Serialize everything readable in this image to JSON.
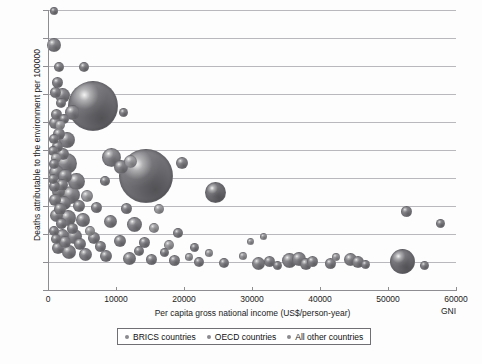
{
  "chart_data": {
    "type": "scatter",
    "title": "",
    "xlabel": "Per capita gross national income (US$/person-year)",
    "ylabel": "Deaths attributable to the environment per 100000",
    "x_axis_note": "GNI",
    "xlim": [
      0,
      60000
    ],
    "ylim": [
      0,
      500
    ],
    "xticks": [
      0,
      10000,
      20000,
      30000,
      40000,
      50000,
      60000
    ],
    "xtick_labels": [
      "0",
      "10000",
      "20000",
      "30000",
      "40000",
      "50000",
      "60000"
    ],
    "yticks": [
      0,
      50,
      100,
      150,
      200,
      250,
      300,
      350,
      400,
      450,
      500
    ],
    "ytick_labels": [
      "0",
      "50",
      "100",
      "150",
      "200",
      "250",
      "300",
      "350",
      "400",
      "450",
      "500"
    ],
    "grid": "horizontal",
    "legend_position": "bottom",
    "legend": [
      {
        "label": "BRICS countries",
        "color": "#8a8a8f"
      },
      {
        "label": "OECD countries",
        "color": "#8a8a8f"
      },
      {
        "label": "All other countries",
        "color": "#8a8a8f"
      }
    ],
    "bubble_size_meaning": "population",
    "points": [
      {
        "x": 800,
        "y": 500,
        "r": 3.0,
        "tone": "mid"
      },
      {
        "x": 700,
        "y": 440,
        "r": 6.0,
        "tone": "mid"
      },
      {
        "x": 1400,
        "y": 400,
        "r": 4.0,
        "tone": "mid"
      },
      {
        "x": 5200,
        "y": 400,
        "r": 4.0,
        "tone": "mid"
      },
      {
        "x": 1200,
        "y": 372,
        "r": 4.5,
        "tone": "mid"
      },
      {
        "x": 900,
        "y": 355,
        "r": 4.5,
        "tone": "mid"
      },
      {
        "x": 2000,
        "y": 350,
        "r": 6.5,
        "tone": "mid"
      },
      {
        "x": 6400,
        "y": 330,
        "r": 24.0,
        "tone": "dark"
      },
      {
        "x": 3500,
        "y": 318,
        "r": 6.5,
        "tone": "mid"
      },
      {
        "x": 1100,
        "y": 316,
        "r": 4.5,
        "tone": "mid"
      },
      {
        "x": 2200,
        "y": 308,
        "r": 4.0,
        "tone": "mid"
      },
      {
        "x": 900,
        "y": 300,
        "r": 5.0,
        "tone": "mid"
      },
      {
        "x": 1600,
        "y": 296,
        "r": 4.0,
        "tone": "light"
      },
      {
        "x": 11000,
        "y": 318,
        "r": 3.5,
        "tone": "mid"
      },
      {
        "x": 1500,
        "y": 280,
        "r": 5.0,
        "tone": "mid"
      },
      {
        "x": 700,
        "y": 272,
        "r": 4.0,
        "tone": "mid"
      },
      {
        "x": 2600,
        "y": 270,
        "r": 7.0,
        "tone": "mid"
      },
      {
        "x": 1300,
        "y": 258,
        "r": 4.5,
        "tone": "mid"
      },
      {
        "x": 600,
        "y": 250,
        "r": 4.0,
        "tone": "mid"
      },
      {
        "x": 2000,
        "y": 244,
        "r": 5.0,
        "tone": "mid"
      },
      {
        "x": 1000,
        "y": 238,
        "r": 4.0,
        "tone": "light"
      },
      {
        "x": 2600,
        "y": 228,
        "r": 9.5,
        "tone": "mid"
      },
      {
        "x": 14200,
        "y": 205,
        "r": 26.0,
        "tone": "dark"
      },
      {
        "x": 9200,
        "y": 238,
        "r": 8.5,
        "tone": "mid"
      },
      {
        "x": 10600,
        "y": 222,
        "r": 6.0,
        "tone": "mid"
      },
      {
        "x": 12000,
        "y": 232,
        "r": 5.5,
        "tone": "light"
      },
      {
        "x": 19600,
        "y": 228,
        "r": 5.0,
        "tone": "mid"
      },
      {
        "x": 1100,
        "y": 212,
        "r": 6.5,
        "tone": "mid"
      },
      {
        "x": 2400,
        "y": 206,
        "r": 6.0,
        "tone": "mid"
      },
      {
        "x": 600,
        "y": 200,
        "r": 4.0,
        "tone": "mid"
      },
      {
        "x": 4100,
        "y": 196,
        "r": 7.5,
        "tone": "mid"
      },
      {
        "x": 8200,
        "y": 196,
        "r": 4.0,
        "tone": "mid"
      },
      {
        "x": 24500,
        "y": 176,
        "r": 9.5,
        "tone": "dark"
      },
      {
        "x": 1400,
        "y": 178,
        "r": 5.5,
        "tone": "mid"
      },
      {
        "x": 3200,
        "y": 172,
        "r": 8.0,
        "tone": "mid"
      },
      {
        "x": 5600,
        "y": 170,
        "r": 5.0,
        "tone": "light"
      },
      {
        "x": 900,
        "y": 162,
        "r": 5.0,
        "tone": "mid"
      },
      {
        "x": 2200,
        "y": 158,
        "r": 6.0,
        "tone": "mid"
      },
      {
        "x": 4400,
        "y": 152,
        "r": 5.0,
        "tone": "mid"
      },
      {
        "x": 7000,
        "y": 150,
        "r": 4.5,
        "tone": "mid"
      },
      {
        "x": 11400,
        "y": 148,
        "r": 4.5,
        "tone": "mid"
      },
      {
        "x": 16200,
        "y": 146,
        "r": 4.0,
        "tone": "light"
      },
      {
        "x": 52600,
        "y": 142,
        "r": 4.5,
        "tone": "mid"
      },
      {
        "x": 57600,
        "y": 120,
        "r": 3.5,
        "tone": "mid"
      },
      {
        "x": 1100,
        "y": 134,
        "r": 5.5,
        "tone": "mid"
      },
      {
        "x": 2800,
        "y": 130,
        "r": 7.0,
        "tone": "mid"
      },
      {
        "x": 5000,
        "y": 126,
        "r": 6.0,
        "tone": "mid"
      },
      {
        "x": 9000,
        "y": 124,
        "r": 5.5,
        "tone": "mid"
      },
      {
        "x": 12600,
        "y": 118,
        "r": 6.5,
        "tone": "mid"
      },
      {
        "x": 15400,
        "y": 112,
        "r": 4.0,
        "tone": "light"
      },
      {
        "x": 19000,
        "y": 104,
        "r": 4.0,
        "tone": "mid"
      },
      {
        "x": 700,
        "y": 108,
        "r": 4.0,
        "tone": "mid"
      },
      {
        "x": 2000,
        "y": 100,
        "r": 5.5,
        "tone": "mid"
      },
      {
        "x": 3800,
        "y": 98,
        "r": 6.5,
        "tone": "mid"
      },
      {
        "x": 6600,
        "y": 94,
        "r": 5.0,
        "tone": "mid"
      },
      {
        "x": 10400,
        "y": 90,
        "r": 5.0,
        "tone": "mid"
      },
      {
        "x": 14000,
        "y": 86,
        "r": 4.5,
        "tone": "mid"
      },
      {
        "x": 17600,
        "y": 82,
        "r": 4.0,
        "tone": "light"
      },
      {
        "x": 21400,
        "y": 78,
        "r": 3.5,
        "tone": "mid"
      },
      {
        "x": 1300,
        "y": 76,
        "r": 5.0,
        "tone": "mid"
      },
      {
        "x": 3000,
        "y": 70,
        "r": 6.0,
        "tone": "mid"
      },
      {
        "x": 5400,
        "y": 66,
        "r": 5.5,
        "tone": "mid"
      },
      {
        "x": 8400,
        "y": 62,
        "r": 5.0,
        "tone": "mid"
      },
      {
        "x": 11800,
        "y": 58,
        "r": 5.5,
        "tone": "mid"
      },
      {
        "x": 15000,
        "y": 56,
        "r": 4.5,
        "tone": "mid"
      },
      {
        "x": 18400,
        "y": 54,
        "r": 4.5,
        "tone": "mid"
      },
      {
        "x": 22000,
        "y": 52,
        "r": 4.0,
        "tone": "mid"
      },
      {
        "x": 25800,
        "y": 50,
        "r": 4.0,
        "tone": "mid"
      },
      {
        "x": 28600,
        "y": 62,
        "r": 3.0,
        "tone": "light"
      },
      {
        "x": 30800,
        "y": 50,
        "r": 5.5,
        "tone": "mid"
      },
      {
        "x": 32400,
        "y": 52,
        "r": 4.5,
        "tone": "mid"
      },
      {
        "x": 33600,
        "y": 46,
        "r": 3.5,
        "tone": "mid"
      },
      {
        "x": 35400,
        "y": 54,
        "r": 6.5,
        "tone": "mid"
      },
      {
        "x": 36800,
        "y": 58,
        "r": 6.0,
        "tone": "mid"
      },
      {
        "x": 37800,
        "y": 48,
        "r": 5.0,
        "tone": "mid"
      },
      {
        "x": 38800,
        "y": 52,
        "r": 4.5,
        "tone": "mid"
      },
      {
        "x": 41400,
        "y": 50,
        "r": 4.5,
        "tone": "mid"
      },
      {
        "x": 42200,
        "y": 60,
        "r": 3.0,
        "tone": "light"
      },
      {
        "x": 44400,
        "y": 56,
        "r": 5.5,
        "tone": "mid"
      },
      {
        "x": 45400,
        "y": 52,
        "r": 5.0,
        "tone": "mid"
      },
      {
        "x": 46600,
        "y": 48,
        "r": 3.5,
        "tone": "mid"
      },
      {
        "x": 52000,
        "y": 52,
        "r": 11.5,
        "tone": "dark"
      },
      {
        "x": 55200,
        "y": 46,
        "r": 3.5,
        "tone": "mid"
      },
      {
        "x": 29600,
        "y": 88,
        "r": 2.5,
        "tone": "light"
      },
      {
        "x": 31600,
        "y": 98,
        "r": 2.5,
        "tone": "light"
      },
      {
        "x": 20600,
        "y": 60,
        "r": 3.0,
        "tone": "light"
      },
      {
        "x": 23600,
        "y": 68,
        "r": 3.0,
        "tone": "light"
      },
      {
        "x": 17000,
        "y": 68,
        "r": 3.5,
        "tone": "mid"
      },
      {
        "x": 13200,
        "y": 72,
        "r": 4.0,
        "tone": "mid"
      },
      {
        "x": 7600,
        "y": 80,
        "r": 4.5,
        "tone": "mid"
      },
      {
        "x": 4600,
        "y": 84,
        "r": 5.0,
        "tone": "mid"
      },
      {
        "x": 2400,
        "y": 88,
        "r": 5.0,
        "tone": "mid"
      },
      {
        "x": 1000,
        "y": 92,
        "r": 4.0,
        "tone": "mid"
      },
      {
        "x": 1800,
        "y": 120,
        "r": 4.5,
        "tone": "mid"
      },
      {
        "x": 3400,
        "y": 112,
        "r": 4.5,
        "tone": "mid"
      },
      {
        "x": 6000,
        "y": 108,
        "r": 4.0,
        "tone": "light"
      },
      {
        "x": 1600,
        "y": 146,
        "r": 5.0,
        "tone": "mid"
      },
      {
        "x": 800,
        "y": 186,
        "r": 4.5,
        "tone": "mid"
      },
      {
        "x": 1900,
        "y": 190,
        "r": 5.0,
        "tone": "mid"
      },
      {
        "x": 700,
        "y": 226,
        "r": 4.0,
        "tone": "mid"
      },
      {
        "x": 1800,
        "y": 336,
        "r": 4.0,
        "tone": "mid"
      }
    ]
  }
}
